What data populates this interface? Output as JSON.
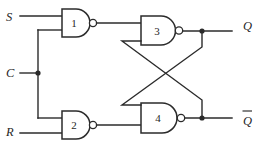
{
  "diagram": {
    "background_color": "#ffffff",
    "line_color": "#2b2b2b",
    "width": 263,
    "height": 151
  },
  "inputs": [
    {
      "id": "S",
      "label": "S",
      "x": 8,
      "y": 23,
      "wire_y": 16
    },
    {
      "id": "C",
      "label": "C",
      "x": 8,
      "y": 73,
      "wire_y": 73
    },
    {
      "id": "R",
      "label": "R",
      "x": 8,
      "y": 131,
      "wire_y": 133
    }
  ],
  "outputs": [
    {
      "id": "Q",
      "label": "Q",
      "overbar": false,
      "x": 245,
      "y": 25,
      "wire_y": 31
    },
    {
      "id": "Qbar",
      "label": "Q",
      "overbar": true,
      "x": 245,
      "y": 120,
      "wire_y": 118
    }
  ],
  "gates": [
    {
      "id": "g1",
      "number": "1",
      "type": "nand",
      "x": 62,
      "y": 9,
      "w": 27,
      "h": 28,
      "cx": 74,
      "cy": 23
    },
    {
      "id": "g2",
      "number": "2",
      "type": "nand",
      "x": 62,
      "y": 111,
      "w": 27,
      "h": 28,
      "cx": 74,
      "cy": 125
    },
    {
      "id": "g3",
      "number": "3",
      "type": "nand",
      "x": 141,
      "y": 16,
      "w": 35,
      "h": 29,
      "cx": 156,
      "cy": 31
    },
    {
      "id": "g4",
      "number": "4",
      "type": "nand",
      "x": 141,
      "y": 103,
      "w": 37,
      "h": 30,
      "cx": 157,
      "cy": 118
    }
  ],
  "junctions": [
    {
      "id": "c-fanout",
      "x": 38,
      "y": 73
    },
    {
      "id": "q-tap",
      "x": 202,
      "y": 31
    },
    {
      "id": "qbar-tap",
      "x": 202,
      "y": 118
    }
  ],
  "nets": [
    {
      "id": "net-s-in",
      "from": "S",
      "to": "gate1-input-a"
    },
    {
      "id": "net-c-fanout",
      "from": "C",
      "to": "gate1-input-b and gate2-input-a"
    },
    {
      "id": "net-r-in",
      "from": "R",
      "to": "gate2-input-b"
    },
    {
      "id": "net-g1-g3",
      "from": "gate1-output",
      "to": "gate3-input-a"
    },
    {
      "id": "net-g2-g4",
      "from": "gate2-output",
      "to": "gate4-input-b"
    },
    {
      "id": "net-q",
      "from": "gate3-output",
      "to": "Q"
    },
    {
      "id": "net-qbar",
      "from": "gate4-output",
      "to": "Qbar"
    },
    {
      "id": "net-cross-qbar-to-g3",
      "from": "Qbar tap",
      "to": "gate3-input-b"
    },
    {
      "id": "net-cross-q-to-g4",
      "from": "Q tap",
      "to": "gate4-input-a"
    }
  ]
}
